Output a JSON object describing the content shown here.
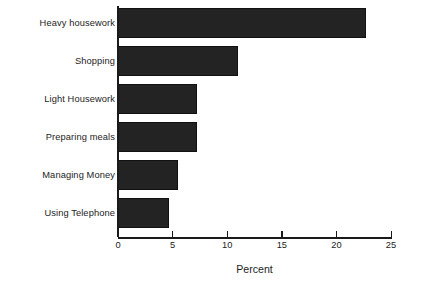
{
  "chart_data": {
    "type": "bar",
    "orientation": "horizontal",
    "title": "",
    "subtitle": "",
    "xlabel": "Percent",
    "ylabel": "",
    "categories": [
      "Heavy housework",
      "Shopping",
      "Light Housework",
      "Preparing meals",
      "Managing Money",
      "Using Telephone"
    ],
    "values": [
      22.7,
      11.0,
      7.2,
      7.2,
      5.5,
      4.7
    ],
    "xlim": [
      0,
      25
    ],
    "xticks": [
      0,
      5,
      10,
      15,
      20,
      25
    ],
    "xtick_labels": [
      "0",
      "5",
      "10",
      "15",
      "20",
      "25"
    ],
    "grid": false,
    "legend": false,
    "bar_color": "#232323",
    "background_color": "#ffffff",
    "axis_color": "#1a1a1a"
  }
}
